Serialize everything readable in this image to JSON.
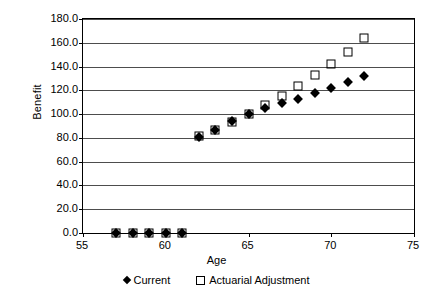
{
  "chart_data": {
    "type": "scatter",
    "title": "",
    "xlabel": "Age",
    "ylabel": "Benefit",
    "xlim": [
      55,
      75
    ],
    "ylim": [
      0,
      180
    ],
    "x_ticks": [
      55,
      60,
      65,
      70,
      75
    ],
    "y_ticks": [
      0,
      20,
      40,
      60,
      80,
      100,
      120,
      140,
      160,
      180
    ],
    "x_tick_labels": [
      "55",
      "60",
      "65",
      "70",
      "75"
    ],
    "y_tick_labels": [
      "0.0",
      "20.0",
      "40.0",
      "60.0",
      "80.0",
      "100.0",
      "120.0",
      "140.0",
      "160.0",
      "180.0"
    ],
    "grid": "horizontal",
    "legend_position": "bottom",
    "x": [
      57,
      58,
      59,
      60,
      61,
      62,
      63,
      64,
      65,
      66,
      67,
      68,
      69,
      70,
      71,
      72
    ],
    "series": [
      {
        "name": "Current",
        "marker": "filled-diamond",
        "color": "#000000",
        "values": [
          0,
          0,
          0,
          0,
          0,
          81,
          87,
          94,
          100,
          105,
          109,
          113,
          118,
          122,
          127,
          132
        ]
      },
      {
        "name": "Actuarial Adjustment",
        "marker": "open-square",
        "color": "#000000",
        "values": [
          0,
          0,
          0,
          0,
          0,
          82,
          87,
          93,
          100,
          108,
          115,
          124,
          133,
          142,
          152,
          164
        ]
      }
    ]
  },
  "legend": {
    "entries": [
      {
        "label": "Current"
      },
      {
        "label": "Actuarial Adjustment"
      }
    ]
  }
}
